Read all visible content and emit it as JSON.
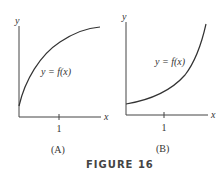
{
  "figure": {
    "caption": "FIGURE 16",
    "panels": [
      {
        "id": "A",
        "label": "(A)",
        "x_axis_label": "x",
        "y_axis_label": "y",
        "tick_label": "1",
        "curve_label": "y = f(x)",
        "curve_description": "increasing, concave down"
      },
      {
        "id": "B",
        "label": "(B)",
        "x_axis_label": "x",
        "y_axis_label": "y",
        "tick_label": "1",
        "curve_label": "y = f(x)",
        "curve_description": "increasing, concave up"
      }
    ]
  },
  "colors": {
    "ink": "#333333",
    "background": "#ffffff"
  }
}
